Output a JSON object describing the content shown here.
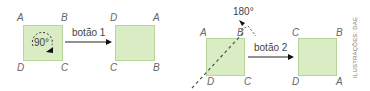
{
  "panel1": {
    "source_square": {
      "corners": {
        "top_left": "A",
        "top_right": "B",
        "bottom_left": "D",
        "bottom_right": "C"
      },
      "rotation_label": "90°"
    },
    "button_label": "botão 1",
    "result_square": {
      "corners": {
        "top_left": "D",
        "top_right": "A",
        "bottom_left": "C",
        "bottom_right": "B"
      }
    }
  },
  "panel2": {
    "source_square": {
      "corners": {
        "top_left": "A",
        "top_right": "B",
        "bottom_left": "D",
        "bottom_right": "C"
      },
      "rotation_label": "180°",
      "axis": "diagonal BD"
    },
    "button_label": "botão 2",
    "result_square": {
      "corners": {
        "top_left": "C",
        "top_right": "B",
        "bottom_left": "D",
        "bottom_right": "A"
      }
    }
  },
  "credit": "ILUSTRAÇÕES: DAE",
  "colors": {
    "square_fill": "#d9ecc4",
    "square_border": "#b9d69a",
    "arrow": "#222222"
  }
}
